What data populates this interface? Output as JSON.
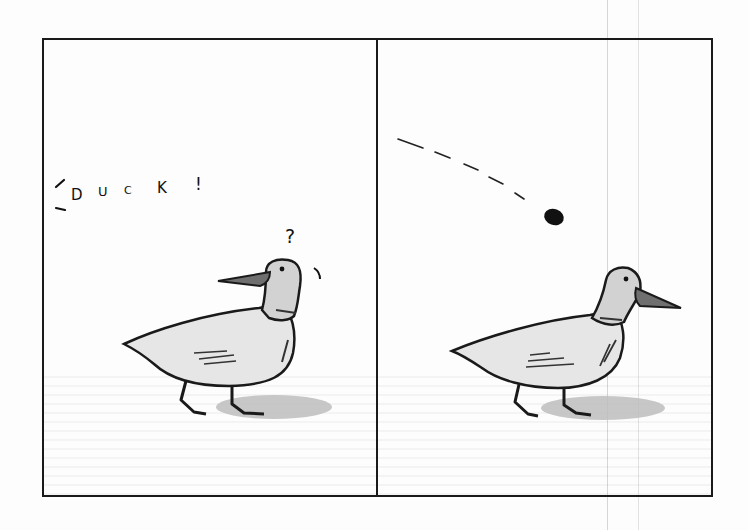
{
  "comic": {
    "panels": [
      {
        "id": 1,
        "caption": "DUCK!",
        "caption_letters": [
          "D",
          "U",
          "C",
          "K",
          "!"
        ],
        "thought_mark": "?",
        "subject": "duck looking back over shoulder, puzzled"
      },
      {
        "id": 2,
        "subject": "duck walking forward, looking right",
        "projectile": "small dark stone on dashed arc trajectory"
      }
    ]
  },
  "colors": {
    "ink": "#1a1a1a",
    "duck_body": "#e4e4e4",
    "duck_head": "#cfcfcf",
    "beak": "#6e6e6e",
    "shadow": "#b8b8b8",
    "guide_line": "#d6d6d6"
  }
}
